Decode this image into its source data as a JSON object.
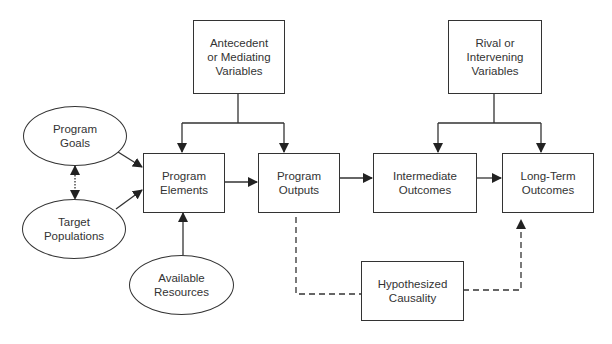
{
  "diagram": {
    "nodes": {
      "antecedent": {
        "label": "Antecedent\nor Mediating\nVariables",
        "shape": "rect"
      },
      "rival": {
        "label": "Rival or\nIntervening\nVariables",
        "shape": "rect"
      },
      "program_goals": {
        "label": "Program\nGoals",
        "shape": "ellipse"
      },
      "target_populations": {
        "label": "Target\nPopulations",
        "shape": "ellipse"
      },
      "available_resources": {
        "label": "Available\nResources",
        "shape": "ellipse"
      },
      "program_elements": {
        "label": "Program\nElements",
        "shape": "rect"
      },
      "program_outputs": {
        "label": "Program\nOutputs",
        "shape": "rect"
      },
      "intermediate_outcomes": {
        "label": "Intermediate\nOutcomes",
        "shape": "rect"
      },
      "long_term_outcomes": {
        "label": "Long-Term\nOutcomes",
        "shape": "rect"
      },
      "hypothesized_causality": {
        "label": "Hypothesized\nCausality",
        "shape": "rect"
      }
    },
    "edges": [
      {
        "from": "antecedent",
        "to": "program_elements",
        "style": "solid"
      },
      {
        "from": "antecedent",
        "to": "program_outputs",
        "style": "solid"
      },
      {
        "from": "rival",
        "to": "intermediate_outcomes",
        "style": "solid"
      },
      {
        "from": "rival",
        "to": "long_term_outcomes",
        "style": "solid"
      },
      {
        "from": "program_goals",
        "to": "program_elements",
        "style": "solid"
      },
      {
        "from": "target_populations",
        "to": "program_elements",
        "style": "solid"
      },
      {
        "from": "program_goals",
        "to": "target_populations",
        "style": "dotted-bidirectional"
      },
      {
        "from": "available_resources",
        "to": "program_elements",
        "style": "solid"
      },
      {
        "from": "program_elements",
        "to": "program_outputs",
        "style": "solid"
      },
      {
        "from": "program_outputs",
        "to": "intermediate_outcomes",
        "style": "solid"
      },
      {
        "from": "intermediate_outcomes",
        "to": "long_term_outcomes",
        "style": "solid"
      },
      {
        "from": "program_outputs",
        "to": "long_term_outcomes",
        "via": "hypothesized_causality",
        "style": "dashed"
      }
    ],
    "colors": {
      "line": "#333333",
      "background": "#ffffff"
    }
  }
}
